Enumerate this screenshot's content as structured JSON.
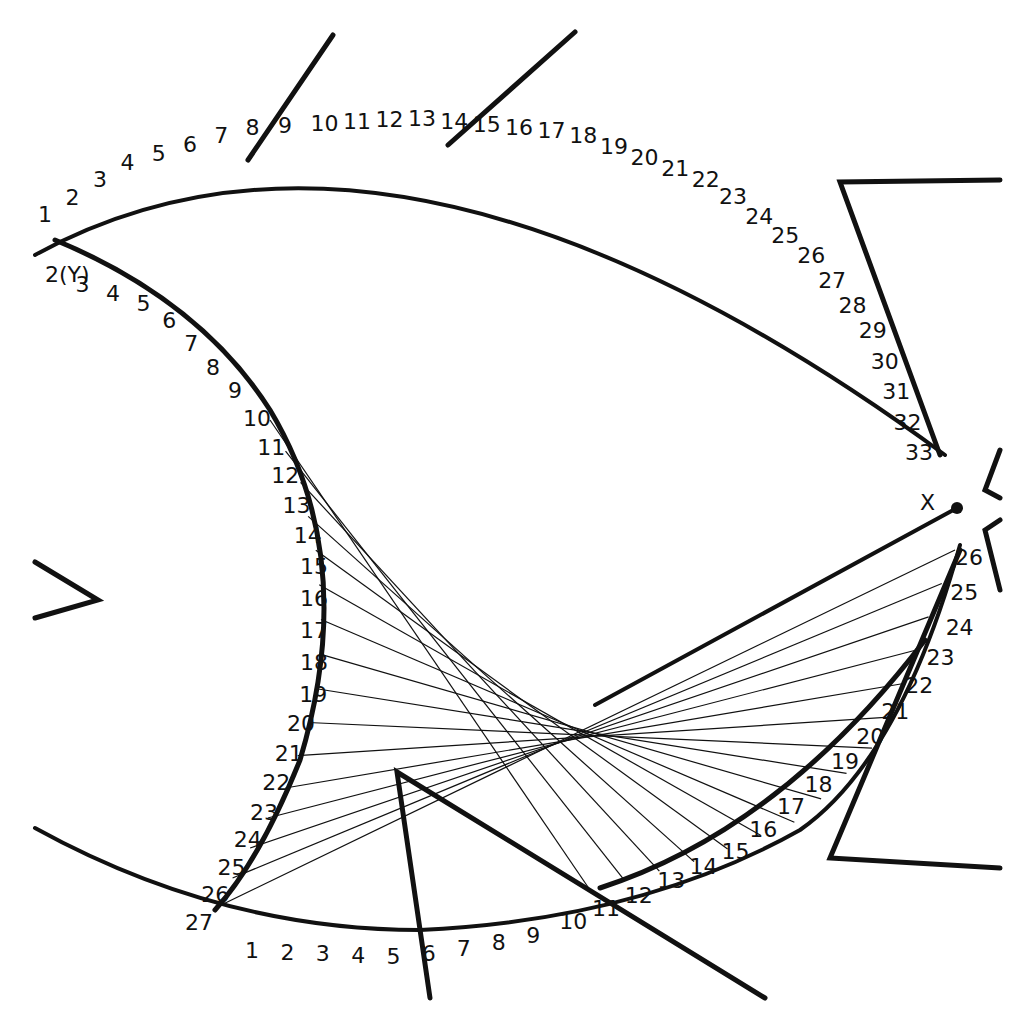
{
  "diagram": {
    "stroke_color": "#111111",
    "background": "#ffffff",
    "top_arc": {
      "labels": [
        "1",
        "2",
        "3",
        "4",
        "5",
        "6",
        "7",
        "8",
        "9",
        "10",
        "11",
        "12",
        "13",
        "14",
        "15",
        "16",
        "17",
        "18",
        "19",
        "20",
        "21",
        "22",
        "23",
        "24",
        "25",
        "26",
        "27",
        "28",
        "29",
        "30",
        "31",
        "32",
        "33"
      ]
    },
    "left_arc": {
      "labels": [
        "2(Y)",
        "3",
        "4",
        "5",
        "6",
        "7",
        "8",
        "9",
        "10",
        "11",
        "12",
        "13",
        "14",
        "15",
        "16",
        "17",
        "18",
        "19",
        "20",
        "21",
        "22",
        "23",
        "24",
        "25",
        "26",
        "27"
      ]
    },
    "bottom_arc": {
      "labels": [
        "1",
        "2",
        "3",
        "4",
        "5",
        "6",
        "7",
        "8",
        "9",
        "10",
        "11",
        "12",
        "13",
        "14",
        "15",
        "16",
        "17",
        "18",
        "19",
        "20",
        "21",
        "22",
        "23",
        "24",
        "25",
        "26"
      ]
    },
    "point_x_label": "X"
  }
}
